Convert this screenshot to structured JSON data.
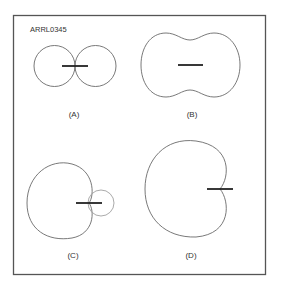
{
  "figure": {
    "id_label": "ARRL0345",
    "panels": [
      {
        "key": "A",
        "label": "(A)",
        "pattern": "figure-eight dipole, two circular lobes"
      },
      {
        "key": "B",
        "label": "(B)",
        "pattern": "peanut-shaped omnidirectional-ish pattern"
      },
      {
        "key": "C",
        "label": "(C)",
        "pattern": "cardioid with small back lobe"
      },
      {
        "key": "D",
        "label": "(D)",
        "pattern": "cardioid with null at rear"
      }
    ]
  },
  "colors": {
    "frame": "#555555",
    "pattern": "#6a6a6a",
    "back_lobe": "#a0a0a0",
    "element": "#222222",
    "background": "#ffffff"
  }
}
